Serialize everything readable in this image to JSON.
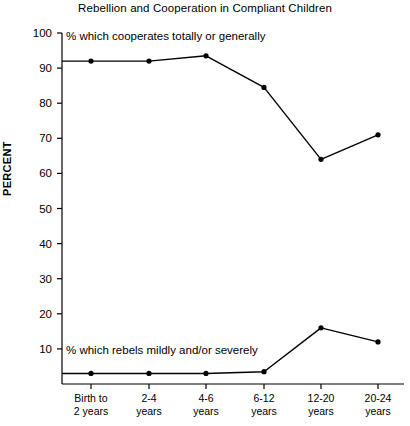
{
  "chart_data": {
    "type": "line",
    "title": "Rebellion and Cooperation in Compliant Children",
    "xlabel": "",
    "ylabel": "PERCENT",
    "ylim": [
      0,
      100
    ],
    "yticks": [
      10,
      20,
      30,
      40,
      50,
      60,
      70,
      80,
      90,
      100
    ],
    "grid": false,
    "legend_position": "inline-annotation",
    "categories": [
      "Birth to 2 years",
      "2-4 years",
      "4-6 years",
      "6-12 years",
      "12-20 years",
      "20-24 years"
    ],
    "category_lines": [
      [
        "Birth to",
        "2 years"
      ],
      [
        "2-4",
        "years"
      ],
      [
        "4-6",
        "years"
      ],
      [
        "6-12",
        "years"
      ],
      [
        "12-20",
        "years"
      ],
      [
        "20-24",
        "years"
      ]
    ],
    "series": [
      {
        "name": "% which cooperates totally or generally",
        "values": [
          92,
          92,
          93.5,
          84.5,
          64,
          71
        ]
      },
      {
        "name": "% which rebels mildly and/or severely",
        "values": [
          3,
          3,
          3,
          3.5,
          16,
          12
        ]
      }
    ]
  },
  "axis": {
    "y_tick_labels": [
      "100",
      "90",
      "80",
      "70",
      "60",
      "50",
      "40",
      "30",
      "20",
      "10"
    ],
    "y_axis_title": "PERCENT"
  },
  "annotations": {
    "upper": "% which cooperates totally or generally",
    "lower": "% which rebels mildly and/or severely"
  },
  "style": {
    "line_color": "#000000",
    "marker_color": "#000000",
    "axis_color": "#000000",
    "background": "#ffffff"
  }
}
